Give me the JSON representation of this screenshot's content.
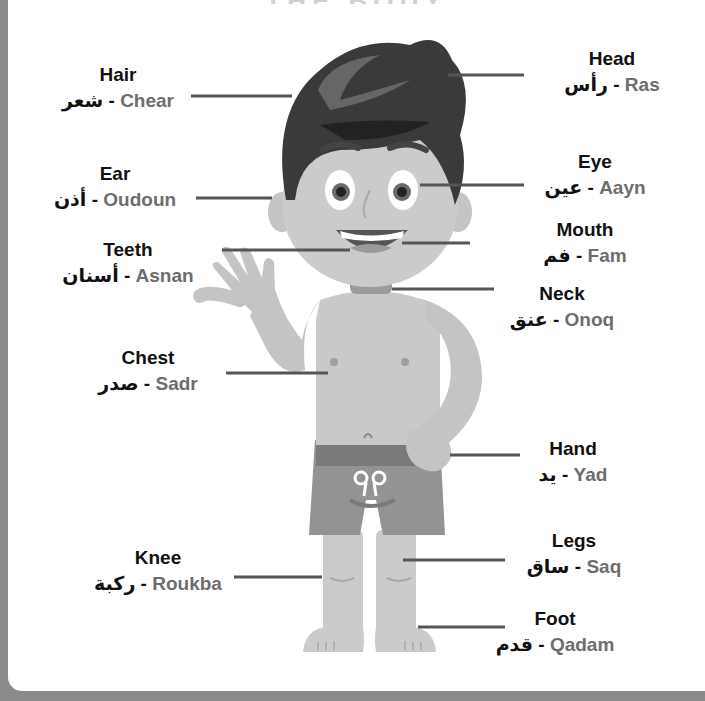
{
  "title": "THE BODY",
  "colors": {
    "frame": "#8a8a8a",
    "panel": "#ffffff",
    "english_text": "#111111",
    "romanization_text": "#6d6d6d",
    "leader_line": "#555555",
    "skin": "#c9c9c9",
    "hair": "#3a3a3a",
    "shorts": "#8c8c8c"
  },
  "labels": [
    {
      "id": "hair",
      "english": "Hair",
      "arabic": "شعر",
      "romanization": "Chear",
      "x": 118,
      "y": 63
    },
    {
      "id": "head",
      "english": "Head",
      "arabic": "رأس",
      "romanization": "Ras",
      "x": 612,
      "y": 47
    },
    {
      "id": "ear",
      "english": "Ear",
      "arabic": "أذن",
      "romanization": "Oudoun",
      "x": 115,
      "y": 162
    },
    {
      "id": "eye",
      "english": "Eye",
      "arabic": "عين",
      "romanization": "Aayn",
      "x": 595,
      "y": 150
    },
    {
      "id": "teeth",
      "english": "Teeth",
      "arabic": "أسنان",
      "romanization": "Asnan",
      "x": 128,
      "y": 238
    },
    {
      "id": "mouth",
      "english": "Mouth",
      "arabic": "فم",
      "romanization": "Fam",
      "x": 585,
      "y": 218
    },
    {
      "id": "neck",
      "english": "Neck",
      "arabic": "عنق",
      "romanization": "Onoq",
      "x": 562,
      "y": 282
    },
    {
      "id": "chest",
      "english": "Chest",
      "arabic": "صدر",
      "romanization": "Sadr",
      "x": 148,
      "y": 346
    },
    {
      "id": "hand",
      "english": "Hand",
      "arabic": "يد",
      "romanization": "Yad",
      "x": 573,
      "y": 437
    },
    {
      "id": "legs",
      "english": "Legs",
      "arabic": "ساق",
      "romanization": "Saq",
      "x": 574,
      "y": 529
    },
    {
      "id": "knee",
      "english": "Knee",
      "arabic": "ركبة",
      "romanization": "Roukba",
      "x": 158,
      "y": 546
    },
    {
      "id": "foot",
      "english": "Foot",
      "arabic": "قدم",
      "romanization": "Qadam",
      "x": 555,
      "y": 607
    }
  ]
}
